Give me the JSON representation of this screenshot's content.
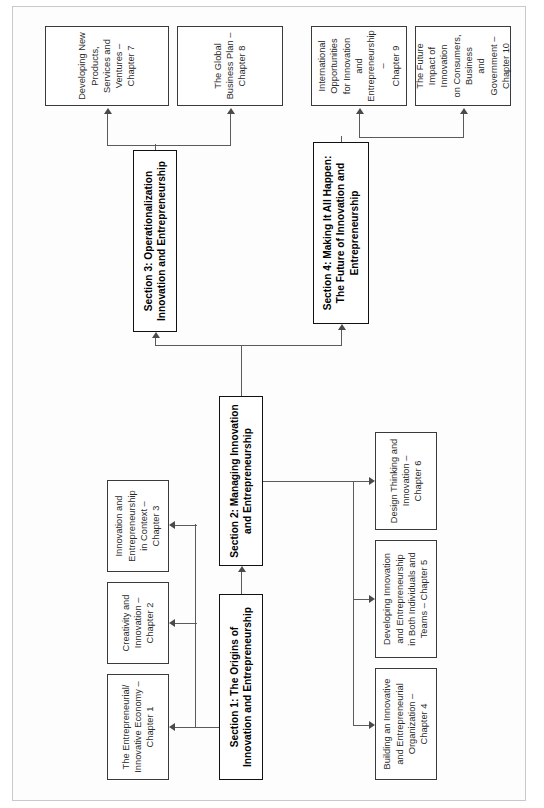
{
  "figure": {
    "orientation": "rotated-90-counterclockwise",
    "type": "flow-diagram",
    "line_color": "#5b5b5b",
    "box_border_color": "#1c1c1c",
    "background": "#ffffff"
  },
  "sections": {
    "s1": {
      "id": "section-1",
      "line1": "Section 1: The Origins of",
      "line2": "Innovation and Entrepreneurship"
    },
    "s2": {
      "id": "section-2",
      "line1": "Section 2: Managing Innovation",
      "line2": "and Entrepreneurship"
    },
    "s3": {
      "id": "section-3",
      "line1": "Section 3: Operationalization",
      "line2": "Innovation and Entrepreneurship"
    },
    "s4": {
      "id": "section-4",
      "line1": "Section 4: Making It All Happen:",
      "line2": "The Future of Innovation and",
      "line3": "Entrepreneurship"
    }
  },
  "chapters": [
    {
      "id": "chapter-1",
      "lines": [
        "The Entrepreneurial/",
        "Innovative Economy –",
        "Chapter 1"
      ]
    },
    {
      "id": "chapter-2",
      "lines": [
        "Creativity and",
        "Innovation –",
        "Chapter 2"
      ]
    },
    {
      "id": "chapter-3",
      "lines": [
        "Innovation and",
        "Entrepreneurship",
        "in Context –",
        "Chapter 3"
      ]
    },
    {
      "id": "chapter-4",
      "lines": [
        "Building an Innovative",
        "and Entrepreneurial",
        "Organization –",
        "Chapter 4"
      ]
    },
    {
      "id": "chapter-5",
      "lines": [
        "Developing Innovation",
        "and Entrepreneurship",
        "in Both Individuals and",
        "Teams – Chapter 5"
      ]
    },
    {
      "id": "chapter-6",
      "lines": [
        "Design Thinking and",
        "Innovation –",
        "Chapter 6"
      ]
    },
    {
      "id": "chapter-7",
      "lines": [
        "Developing New Products,",
        "Services and Ventures –",
        "Chapter 7"
      ]
    },
    {
      "id": "chapter-8",
      "lines": [
        "The Global Business Plan –",
        "Chapter 8"
      ]
    },
    {
      "id": "chapter-9",
      "lines": [
        "International Opportunities",
        "for Innovation and",
        "Entrepreneurship –",
        "Chapter 9"
      ]
    },
    {
      "id": "chapter-10",
      "lines": [
        "The Future Impact of Innovation",
        "on Consumers, Business",
        "and Government –",
        "Chapter 10"
      ]
    }
  ]
}
